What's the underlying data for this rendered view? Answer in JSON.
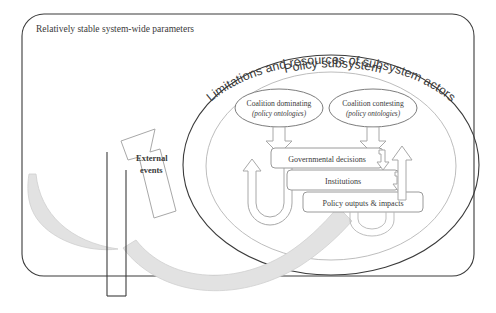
{
  "figure": {
    "outer_frame_label": "Relatively stable system-wide parameters",
    "outer_ellipse_label": "Limitations and resources of subsystem actors",
    "inner_ellipse_label": "Policy subsystem"
  },
  "external": {
    "line1": "External",
    "line2": "events"
  },
  "coalitions": [
    {
      "id": "coalition-dominating",
      "name": "Coalition dominating",
      "subtitle": "(policy ontologies)"
    },
    {
      "id": "coalition-contesting",
      "name": "Coalition contesting",
      "subtitle": "(policy ontologies)"
    }
  ],
  "process_boxes": [
    {
      "id": "governmental-decisions",
      "label": "Governmental decisions"
    },
    {
      "id": "institutions",
      "label": "Institutions"
    },
    {
      "id": "policy-outputs",
      "label": "Policy outputs & impacts"
    }
  ],
  "connectors": [
    {
      "id": "arrow-dominating-to-decisions",
      "kind": "block-arrow-down"
    },
    {
      "id": "arrow-contesting-to-decisions",
      "kind": "block-arrow-down"
    },
    {
      "id": "arrow-decisions-to-institutions",
      "kind": "hook-arrow"
    },
    {
      "id": "arrow-institutions-to-outputs",
      "kind": "hook-arrow"
    },
    {
      "id": "feedback-loop-left",
      "kind": "u-turn-arrow-up"
    },
    {
      "id": "feedback-arrow-right",
      "kind": "block-arrow-up"
    },
    {
      "id": "feedback-loop-bottom",
      "kind": "u-turn-loop"
    },
    {
      "id": "external-events-swoosh-left",
      "kind": "curved-band"
    },
    {
      "id": "external-events-swoosh-right",
      "kind": "curved-band"
    }
  ],
  "colors": {
    "line_dark": "#3b3b3b",
    "line_mid": "#8d8d8d",
    "line_light": "#b5b5b5",
    "band_fill": "#e2e2e2",
    "text": "#3a3a3a"
  }
}
